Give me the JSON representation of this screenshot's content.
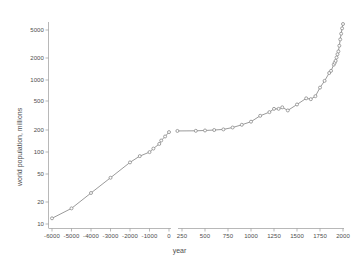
{
  "chart_data": {
    "type": "line",
    "title": "",
    "subtitle": "",
    "xlabel": "year",
    "ylabel": "world population, millions",
    "yscale": "log",
    "ylim": [
      10,
      7000
    ],
    "yticks": [
      10,
      20,
      50,
      100,
      200,
      500,
      1000,
      2000,
      5000
    ],
    "ytick_labels": [
      "10",
      "20",
      "50",
      "100",
      "200",
      "500",
      "1000",
      "2000",
      "5000"
    ],
    "xticks_left": [
      -6000,
      -5000,
      -4000,
      -3000,
      -2000,
      -1000,
      0
    ],
    "xtick_labels_left": [
      "-6000",
      "-5000",
      "-4000",
      "-3000",
      "-2000",
      "-1000",
      "0"
    ],
    "xticks_right": [
      250,
      500,
      750,
      1000,
      1250,
      1500,
      1750,
      2000
    ],
    "xtick_labels_right": [
      "250",
      "500",
      "750",
      "1000",
      "1250",
      "1500",
      "1750",
      "2000"
    ],
    "axis_break": true,
    "axis_break_between": [
      0,
      200
    ],
    "grid": false,
    "legend": "none",
    "marker": "circle",
    "line_color": "#808080",
    "marker_color": "#8a8a8a",
    "axis_color": "#9a9a9a",
    "text_color": "#4d4d4d",
    "series": [
      {
        "name": "world population (prehistoric segment)",
        "segment": "left",
        "x": [
          -6000,
          -5000,
          -4000,
          -3000,
          -2000,
          -1500,
          -1000,
          -800,
          -500,
          -400,
          -200,
          0
        ],
        "y": [
          12,
          16.5,
          27,
          44,
          72,
          88,
          100,
          112,
          130,
          145,
          165,
          190
        ]
      },
      {
        "name": "world population (historic segment)",
        "segment": "right",
        "x": [
          200,
          400,
          500,
          600,
          700,
          800,
          900,
          1000,
          1100,
          1200,
          1250,
          1300,
          1340,
          1400,
          1500,
          1600,
          1650,
          1700,
          1750,
          1800,
          1850,
          1870,
          1900,
          1910,
          1920,
          1930,
          1940,
          1950,
          1960,
          1970,
          1980,
          1990,
          2000
        ],
        "y": [
          197,
          198,
          200,
          203,
          207,
          220,
          240,
          265,
          320,
          360,
          400,
          400,
          420,
          380,
          460,
          560,
          545,
          600,
          790,
          980,
          1260,
          1350,
          1650,
          1750,
          1860,
          2070,
          2300,
          2520,
          3020,
          3700,
          4440,
          5270,
          6060
        ]
      }
    ]
  },
  "axes": {
    "x_title": "year",
    "y_title": "world population, millions"
  }
}
